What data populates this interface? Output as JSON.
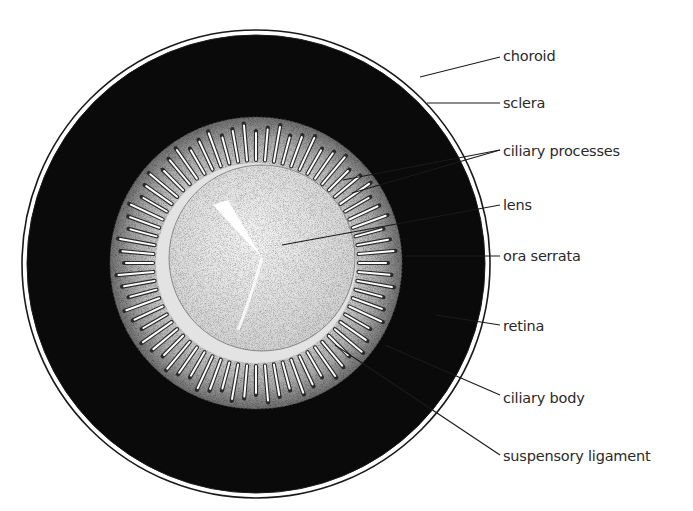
{
  "diagram": {
    "colors": {
      "retina": "#0a0a0a",
      "background": "#ffffff",
      "stipple_light": "#e8e8e8",
      "stipple_mid": "#bdbdbd",
      "line": "#1a1a1a"
    },
    "labels": [
      {
        "id": "choroid",
        "text": "choroid"
      },
      {
        "id": "sclera",
        "text": "sclera"
      },
      {
        "id": "ciliary-processes",
        "text": "ciliary processes"
      },
      {
        "id": "lens",
        "text": "lens"
      },
      {
        "id": "ora-serrata",
        "text": "ora serrata"
      },
      {
        "id": "retina",
        "text": "retina"
      },
      {
        "id": "ciliary-body",
        "text": "ciliary body"
      },
      {
        "id": "suspensory-ligament",
        "text": "suspensory ligament"
      }
    ]
  }
}
